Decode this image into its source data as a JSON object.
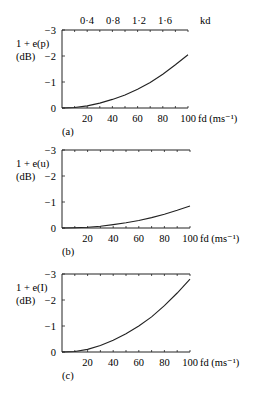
{
  "chart_data": [
    {
      "type": "line",
      "panel_label": "(a)",
      "ylabel_line1": "1 + e(p)",
      "ylabel_line2": "(dB)",
      "xlabel": "fd (ms⁻¹)",
      "top_axis_label": "kd",
      "top_axis_ticks": [
        "0·4",
        "0·8",
        "1·2",
        "1·6"
      ],
      "x_ticks": [
        "20",
        "40",
        "60",
        "80",
        "100"
      ],
      "y_ticks": [
        "0",
        "−1",
        "−2",
        "−3"
      ],
      "xlim": [
        0,
        100
      ],
      "ylim": [
        0,
        -3
      ],
      "x": [
        0,
        10,
        20,
        30,
        40,
        50,
        60,
        70,
        80,
        90,
        100
      ],
      "y": [
        0,
        -0.02,
        -0.08,
        -0.19,
        -0.33,
        -0.5,
        -0.72,
        -0.98,
        -1.3,
        -1.66,
        -2.05
      ]
    },
    {
      "type": "line",
      "panel_label": "(b)",
      "ylabel_line1": "1 + e(u)",
      "ylabel_line2": "(dB)",
      "xlabel": "fd (ms⁻¹)",
      "x_ticks": [
        "20",
        "40",
        "60",
        "80",
        "100"
      ],
      "y_ticks": [
        "0",
        "−1",
        "−2",
        "−3"
      ],
      "xlim": [
        0,
        100
      ],
      "ylim": [
        0,
        -3
      ],
      "x": [
        0,
        10,
        20,
        30,
        40,
        50,
        60,
        70,
        80,
        90,
        100
      ],
      "y": [
        0,
        -0.01,
        -0.03,
        -0.07,
        -0.13,
        -0.2,
        -0.29,
        -0.4,
        -0.53,
        -0.68,
        -0.85
      ]
    },
    {
      "type": "line",
      "panel_label": "(c)",
      "ylabel_line1": "1 + e(I)",
      "ylabel_line2": "(dB)",
      "xlabel": "fd (ms⁻¹)",
      "x_ticks": [
        "20",
        "40",
        "60",
        "80",
        "100"
      ],
      "y_ticks": [
        "0",
        "−1",
        "−2",
        "−3"
      ],
      "xlim": [
        0,
        100
      ],
      "ylim": [
        0,
        -3
      ],
      "x": [
        0,
        10,
        20,
        30,
        40,
        50,
        60,
        70,
        80,
        90,
        100
      ],
      "y": [
        0,
        -0.02,
        -0.1,
        -0.25,
        -0.45,
        -0.7,
        -1.0,
        -1.35,
        -1.78,
        -2.27,
        -2.8
      ]
    }
  ]
}
